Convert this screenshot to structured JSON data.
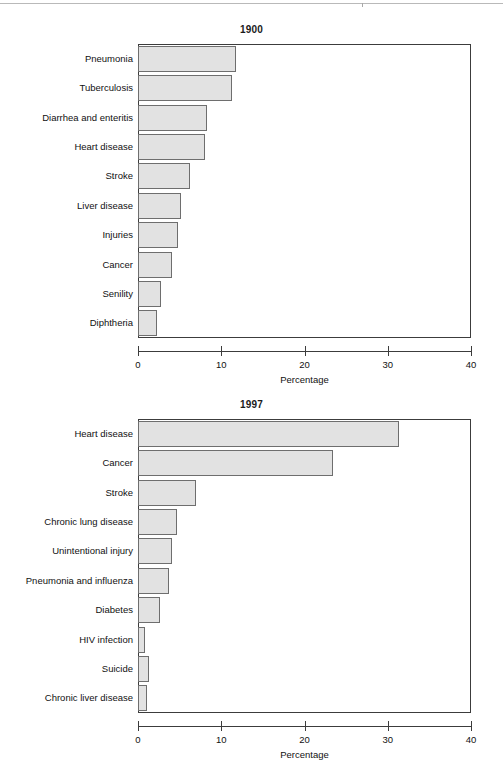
{
  "figures": [
    {
      "id": "chart-1900",
      "title": "1900",
      "xlabel": "Percentage",
      "xticks": [
        "0",
        "10",
        "20",
        "30",
        "40"
      ]
    },
    {
      "id": "chart-1997",
      "title": "1997",
      "xlabel": "Percentage",
      "xticks": [
        "0",
        "10",
        "20",
        "30",
        "40"
      ]
    }
  ],
  "chart_data": [
    {
      "type": "bar",
      "orientation": "horizontal",
      "title": "1900",
      "xlabel": "Percentage",
      "ylabel": "",
      "xlim": [
        0,
        40
      ],
      "xticks": [
        0,
        10,
        20,
        30,
        40
      ],
      "grid": false,
      "legend": "none",
      "bar_color": "#e2e2e2",
      "bar_edge_color": "#6e6e6e",
      "categories": [
        "Pneumonia",
        "Tuberculosis",
        "Diarrhea and enteritis",
        "Heart disease",
        "Stroke",
        "Liver disease",
        "Injuries",
        "Cancer",
        "Senility",
        "Diphtheria"
      ],
      "values": [
        11.8,
        11.3,
        8.3,
        8.0,
        6.2,
        5.2,
        4.8,
        4.1,
        2.8,
        2.3
      ]
    },
    {
      "type": "bar",
      "orientation": "horizontal",
      "title": "1997",
      "xlabel": "Percentage",
      "ylabel": "",
      "xlim": [
        0,
        40
      ],
      "xticks": [
        0,
        10,
        20,
        30,
        40
      ],
      "grid": false,
      "legend": "none",
      "bar_color": "#e2e2e2",
      "bar_edge_color": "#6e6e6e",
      "categories": [
        "Heart disease",
        "Cancer",
        "Stroke",
        "Chronic lung disease",
        "Unintentional injury",
        "Pneumonia and influenza",
        "Diabetes",
        "HIV infection",
        "Suicide",
        "Chronic liver disease"
      ],
      "values": [
        31.4,
        23.4,
        7.0,
        4.7,
        4.1,
        3.7,
        2.7,
        0.8,
        1.3,
        1.1
      ]
    }
  ]
}
